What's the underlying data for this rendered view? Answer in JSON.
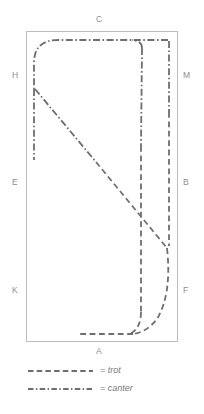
{
  "diagram": {
    "arena": {
      "x": 26,
      "y": 31,
      "width": 151,
      "height": 310,
      "border_color": "#bdbdbd"
    },
    "letters": [
      {
        "label": "C",
        "position": "top-center",
        "x": 98,
        "y": 19
      },
      {
        "label": "H",
        "position": "left-upper",
        "x": 12,
        "y": 75
      },
      {
        "label": "M",
        "position": "right-upper",
        "x": 183,
        "y": 75
      },
      {
        "label": "E",
        "position": "left-middle",
        "x": 12,
        "y": 182
      },
      {
        "label": "B",
        "position": "right-middle",
        "x": 183,
        "y": 182
      },
      {
        "label": "K",
        "position": "left-lower",
        "x": 12,
        "y": 290
      },
      {
        "label": "F",
        "position": "right-lower",
        "x": 183,
        "y": 290
      },
      {
        "label": "A",
        "position": "bottom-center",
        "x": 98,
        "y": 350
      }
    ],
    "gait_color": "#6e6e6e",
    "paths": {
      "canter": {
        "name": "canter",
        "dash": "7,2.5,1.6,2.5",
        "segments": [
          "M 170 40 L 58 40 Q 33 40 33 62 L 33 88",
          "M 33 88 L 33 160",
          "M 170 40 Q 170 40 170 40 L 170 112",
          "M 143 45 Q 143 44 139 43 L 100 41",
          "M 143 45 L 141 145",
          "M 33 88 L 112 182"
        ]
      },
      "trot": {
        "name": "trot",
        "dash": "6,3.5",
        "segments": [
          "M 112 182 L 167 247",
          "M 141 145 L 141 310",
          "M 170 112 L 170 247",
          "M 167 247 Q 171 290 155 317 Q 144 331 130 333",
          "M 141 310 Q 141 326 131 333",
          "M 130 333 L 77 333"
        ]
      }
    }
  },
  "legend": {
    "items": [
      {
        "key": "trot",
        "label": "= trot",
        "style": "dashed",
        "dash": "5.5,3.2"
      },
      {
        "key": "canter",
        "label": "= canter",
        "style": "dash-dot",
        "dash": "5.5,2.4,1.4,2.4"
      }
    ],
    "swatch": {
      "x1": 28,
      "x2": 93,
      "color": "#6e6e6e"
    },
    "rows": [
      {
        "y": 371
      },
      {
        "y": 389
      }
    ],
    "label_x": 100
  }
}
